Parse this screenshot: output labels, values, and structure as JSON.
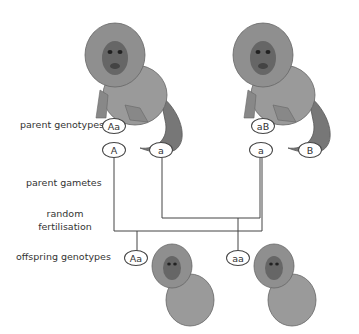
{
  "labels": {
    "parent_genotypes": "parent genotypes",
    "parent_gametes": "parent gametes",
    "random_fertilisation_line1": "random",
    "random_fertilisation_line2": "fertilisation",
    "offspring_genotypes": "offspring genotypes"
  },
  "parents": [
    {
      "genotype": "Aa",
      "gametes": [
        "A",
        "a"
      ]
    },
    {
      "genotype": "aB",
      "gametes": [
        "a",
        "B"
      ]
    }
  ],
  "offspring": [
    {
      "genotype": "Aa"
    },
    {
      "genotype": "aa"
    }
  ],
  "colors": {
    "line": "#444444",
    "monkey_fur": "#8a8a8a",
    "monkey_dark": "#555555",
    "face": "#6d6d6d"
  }
}
